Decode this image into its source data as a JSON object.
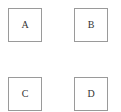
{
  "diagram": {
    "boxes": [
      {
        "label": "A"
      },
      {
        "label": "B"
      },
      {
        "label": "C"
      },
      {
        "label": "D"
      }
    ]
  },
  "colors": {
    "border": "#9a9a9a",
    "text": "#333333",
    "background": "#ffffff"
  }
}
